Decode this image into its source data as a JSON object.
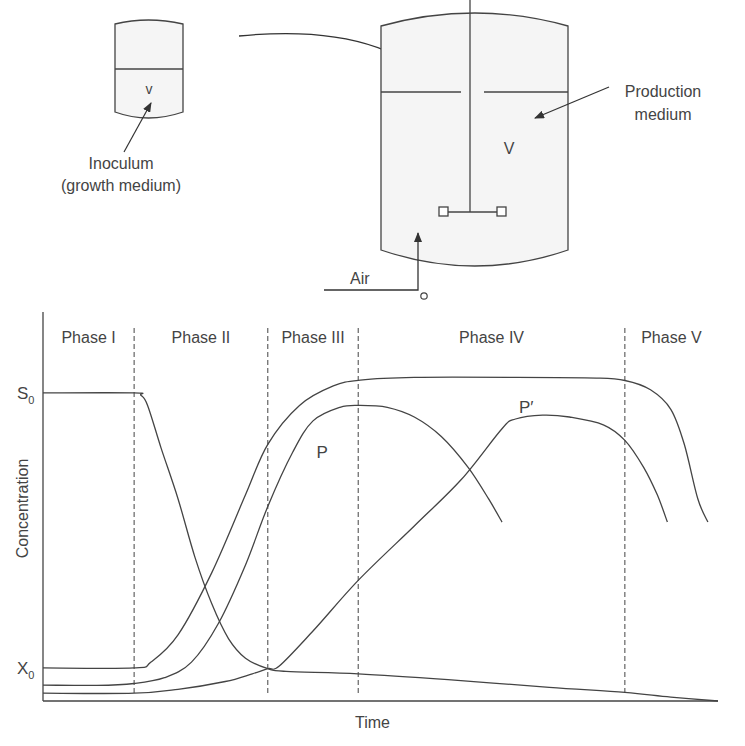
{
  "apparatus": {
    "inoculum_vessel_volume_label": "v",
    "inoculum_label_line1": "Inoculum",
    "inoculum_label_line2": "(growth medium)",
    "production_vessel_volume_label": "V",
    "production_label_line1": "Production",
    "production_label_line2": "medium",
    "air_label": "Air"
  },
  "chart_data": {
    "type": "line",
    "title": "",
    "xlabel": "Time",
    "ylabel": "Concentration",
    "xlim": [
      0,
      100
    ],
    "ylim": [
      0,
      100
    ],
    "grid": false,
    "ytick_labels": [
      {
        "text": "S",
        "sub": "0",
        "value": 79.2
      },
      {
        "text": "X",
        "sub": "0",
        "value": 8.5
      }
    ],
    "phases": [
      {
        "label": "Phase I",
        "start": 0,
        "end": 13.5
      },
      {
        "label": "Phase II",
        "start": 13.5,
        "end": 33.3
      },
      {
        "label": "Phase III",
        "start": 33.3,
        "end": 46.7
      },
      {
        "label": "Phase IV",
        "start": 46.7,
        "end": 86.2
      },
      {
        "label": "Phase V",
        "start": 86.2,
        "end": 100
      }
    ],
    "series": [
      {
        "name": "X",
        "label": "",
        "points": [
          [
            0,
            8.5
          ],
          [
            13.5,
            8.5
          ],
          [
            16,
            10
          ],
          [
            20,
            17
          ],
          [
            25,
            33
          ],
          [
            30,
            53
          ],
          [
            33.3,
            66
          ],
          [
            38,
            76
          ],
          [
            43,
            81
          ],
          [
            47,
            82.5
          ],
          [
            55,
            83.2
          ],
          [
            70,
            83.2
          ],
          [
            82,
            83
          ],
          [
            86.2,
            82.4
          ],
          [
            90,
            80
          ],
          [
            93,
            75
          ],
          [
            95,
            66
          ],
          [
            97,
            52
          ],
          [
            98.5,
            46
          ]
        ]
      },
      {
        "name": "P",
        "label": "P",
        "label_at": [
          40.5,
          62.5
        ],
        "points": [
          [
            0,
            4.1
          ],
          [
            8,
            4
          ],
          [
            13.5,
            4.5
          ],
          [
            18,
            6
          ],
          [
            22,
            10
          ],
          [
            26,
            20
          ],
          [
            30,
            35
          ],
          [
            33.3,
            50
          ],
          [
            37,
            64
          ],
          [
            40,
            72
          ],
          [
            44,
            75.5
          ],
          [
            47,
            76
          ],
          [
            51,
            75.5
          ],
          [
            55,
            73
          ],
          [
            59,
            68
          ],
          [
            63,
            60
          ],
          [
            66,
            52
          ],
          [
            68,
            46
          ]
        ]
      },
      {
        "name": "P'",
        "label": "P′",
        "label_at": [
          70.5,
          74
        ],
        "points": [
          [
            0,
            2
          ],
          [
            13.5,
            2
          ],
          [
            20,
            3
          ],
          [
            27,
            5
          ],
          [
            31,
            7
          ],
          [
            33.3,
            8.3
          ],
          [
            35,
            9
          ],
          [
            40,
            18
          ],
          [
            46.7,
            31
          ],
          [
            55,
            45
          ],
          [
            62,
            57
          ],
          [
            68,
            70
          ],
          [
            70,
            72.5
          ],
          [
            74,
            73.5
          ],
          [
            78,
            73
          ],
          [
            83,
            71
          ],
          [
            86.2,
            67
          ],
          [
            89,
            60
          ],
          [
            91,
            53
          ],
          [
            92.5,
            46
          ]
        ]
      },
      {
        "name": "S",
        "label": "",
        "points": [
          [
            0,
            79.2
          ],
          [
            13.5,
            79.2
          ],
          [
            14.5,
            78.6
          ],
          [
            15.5,
            76
          ],
          [
            17.5,
            65
          ],
          [
            20,
            52
          ],
          [
            22.5,
            37
          ],
          [
            25,
            25
          ],
          [
            27.5,
            16
          ],
          [
            30,
            11
          ],
          [
            33.3,
            8.3
          ],
          [
            36,
            7.6
          ],
          [
            46.7,
            7
          ],
          [
            60,
            5.5
          ],
          [
            75,
            3.5
          ],
          [
            86.2,
            2.2
          ],
          [
            93,
            1
          ],
          [
            100,
            0
          ]
        ]
      }
    ]
  }
}
